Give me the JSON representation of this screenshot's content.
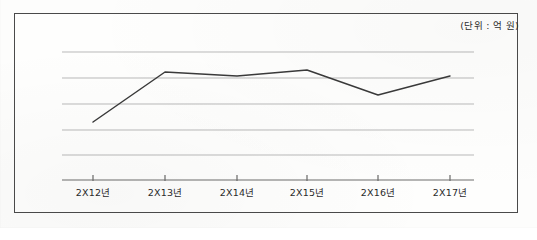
{
  "figure": {
    "unit_note": "(단위 : 억 원)",
    "frame": {
      "left": 14,
      "top": 13,
      "width": 504,
      "height": 200
    }
  },
  "chart_data": {
    "type": "line",
    "title": "",
    "subtitle": "",
    "xlabel": "",
    "ylabel": "",
    "unit_note": "(단위 : 억 원)",
    "categories": [
      "2X12년",
      "2X13년",
      "2X14년",
      "2X15년",
      "2X16년",
      "2X17년"
    ],
    "series": [
      {
        "name": "",
        "values": [
          2.2,
          4.2,
          4.0,
          4.3,
          3.3,
          4.0
        ]
      }
    ],
    "ylim": [
      0,
      6
    ],
    "y_gridline_levels": [
      1,
      2,
      3,
      4,
      5,
      6
    ],
    "y_tick_labels": [],
    "grid": true,
    "legend": false,
    "legend_position": "none",
    "axis_pixels": {
      "plot_left": 62,
      "plot_right": 474,
      "baseline_y": 180,
      "gridline_y": [
        52,
        78,
        104,
        130,
        155,
        180
      ],
      "tick_x": [
        93,
        165,
        237,
        307,
        378,
        450
      ],
      "point_y": [
        122,
        72,
        76,
        70,
        95,
        76
      ]
    },
    "colors": {
      "line": "#3a3a3a",
      "grid": "#b9b9b9",
      "axis": "#6d6d6d",
      "frame": "#4a4a4a",
      "background": "#fdfdfc",
      "text": "#2b2b2b"
    }
  }
}
